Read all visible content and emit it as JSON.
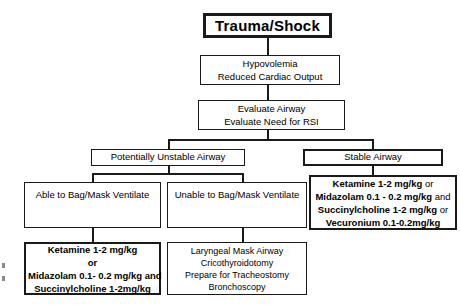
{
  "diagram": {
    "title": "Trauma/Shock",
    "nodes": {
      "root": {
        "label": "Trauma/Shock"
      },
      "hypovolemia": {
        "line1": "Hypovolemia",
        "line2": "Reduced Cardiac Output"
      },
      "evaluate": {
        "line1": "Evaluate Airway",
        "line2": "Evaluate Need for RSI"
      },
      "unstable_airway": {
        "label": "Potentially Unstable Airway"
      },
      "stable_airway": {
        "label": "Stable Airway"
      },
      "able_ventilate": {
        "label": "Able to Bag/Mask Ventilate"
      },
      "unable_ventilate": {
        "label": "Unable to Bag/Mask Ventilate"
      },
      "able_drugs": {
        "line1": "Ketamine 1-2 mg/kg",
        "line2": "or",
        "line3": "Midazolam 0.1- 0.2 mg/kg  and",
        "line4": "Succinylcholine 1-2mg/kg"
      },
      "unable_procedures": {
        "line1": "Laryngeal Mask Airway",
        "line2": "Cricothyroidotomy",
        "line3": "Prepare for Tracheostomy",
        "line4": "Bronchoscopy"
      },
      "stable_drugs": {
        "line1_drug": "Ketamine 1-2 mg/kg",
        "line1_conj": " or",
        "line2_drug": "Midazolam 0.1 - 0.2 mg/kg",
        "line2_conj": "  and",
        "line3_drug": "Succinylcholine 1-2 mg/kg",
        "line3_conj": " or",
        "line4_drug": "Vecuronium 0.1-0.2mg/kg"
      }
    },
    "colors": {
      "ink": "#1a1a1a",
      "background": "#ffffff"
    }
  }
}
